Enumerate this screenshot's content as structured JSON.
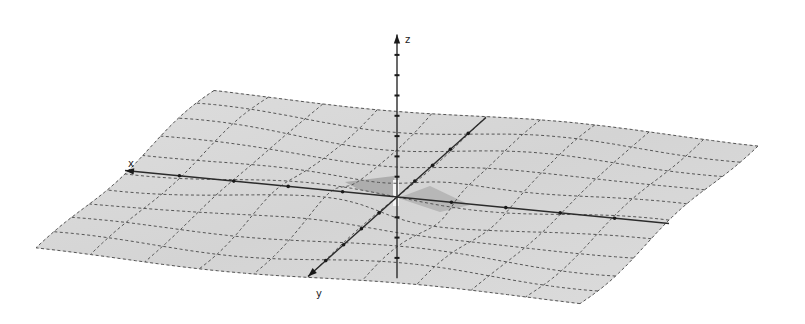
{
  "chart_data": {
    "type": "surface3d",
    "title": "",
    "function_description": "z = f(x, y), nearly flat surface with a singular ridge/spike at the origin and gentle wave ripples",
    "axes": {
      "x": {
        "label": "x",
        "range": [
          -10,
          10
        ],
        "tick_step": 1,
        "tick_labels_visible": false
      },
      "y": {
        "label": "y",
        "range": [
          -10,
          10
        ],
        "tick_step": 1,
        "tick_labels_visible": false
      },
      "z": {
        "label": "z",
        "range": [
          -4,
          8
        ],
        "tick_step": 1,
        "tick_labels_visible": false
      }
    },
    "surface": {
      "x_range": [
        -10,
        10
      ],
      "y_range": [
        -10,
        10
      ],
      "grid_step": 2,
      "mesh_style": "dashed",
      "fill_color": "#d9d9d9",
      "shadow_color": "#8a8a8a",
      "mesh_color": "#555555"
    },
    "axis_color": "#2b2b2b",
    "background": "#ffffff",
    "grid": true,
    "legend": "none"
  }
}
